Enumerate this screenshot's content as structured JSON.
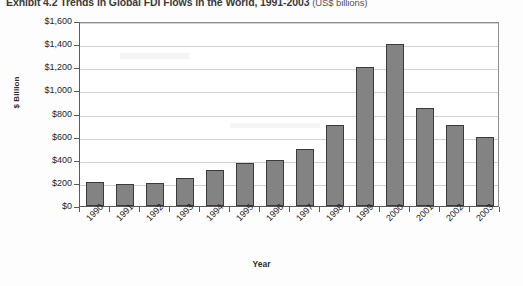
{
  "chart_data": {
    "type": "bar",
    "title": "Exhibit 4.2   Trends in Global FDI Flows in the World, 1991-2003",
    "title_suffix": "(US$ billions)",
    "xlabel": "Year",
    "ylabel": "$ Billion",
    "categories": [
      "1990",
      "1991",
      "1992",
      "1993",
      "1994",
      "1995",
      "1996",
      "1997",
      "1998",
      "1999",
      "2000",
      "2001",
      "2002",
      "2003"
    ],
    "values": [
      205,
      190,
      200,
      245,
      315,
      375,
      395,
      490,
      700,
      1200,
      1400,
      850,
      700,
      600
    ],
    "ylim": [
      0,
      1600
    ],
    "ytick_values": [
      0,
      200,
      400,
      600,
      800,
      1000,
      1200,
      1400,
      1600
    ],
    "ytick_labels": [
      "$0",
      "$200",
      "$400",
      "$600",
      "$800",
      "$1,000",
      "$1,200",
      "$1,400",
      "$1,600"
    ],
    "grid": true,
    "legend": "none",
    "series_name": "Global FDI Flows",
    "bar_color": "#838383",
    "bar_border_color": "#3b3b3b",
    "gridline_color": "#d2d2d2",
    "axis_color": "#5a5a5a"
  }
}
